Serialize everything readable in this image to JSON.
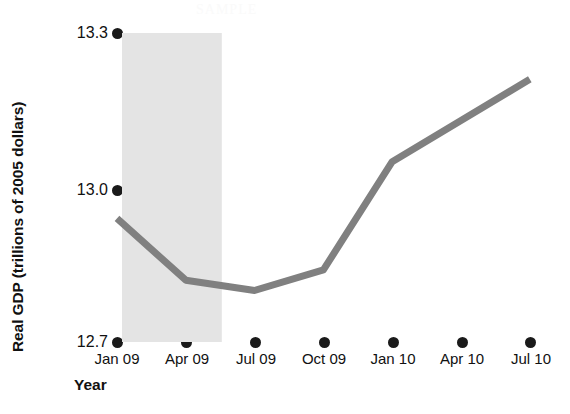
{
  "chart_data": {
    "type": "line",
    "title": "",
    "subtitle": "",
    "xlabel": "Year",
    "ylabel": "Real GDP (trillions of 2005 dollars)",
    "categories": [
      "Jan 09",
      "Apr 09",
      "Jul 09",
      "Oct 09",
      "Jan 10",
      "Apr 10",
      "Jul 10"
    ],
    "values": [
      12.94,
      12.82,
      12.8,
      12.84,
      13.05,
      13.13,
      13.21
    ],
    "series": [
      {
        "name": "Real GDP",
        "values": [
          12.94,
          12.82,
          12.8,
          12.84,
          13.05,
          13.13,
          13.21
        ]
      }
    ],
    "ylim": [
      12.7,
      13.3
    ],
    "yticks": [
      "12.7",
      "13.0",
      "13.3"
    ],
    "ytick_values": [
      12.7,
      13.0,
      13.3
    ],
    "xticks": [
      "Jan 09",
      "Apr 09",
      "Jul 09",
      "Oct 09",
      "Jan 10",
      "Apr 10",
      "Jul 10"
    ],
    "grid": false,
    "legend": "none",
    "line_color": "#808080",
    "marker_color": "#1a1a1a",
    "shaded_region": {
      "label": "recession band",
      "from": "Jan 09",
      "to": "Apr 09",
      "color": "#e4e4e4"
    },
    "annotations": []
  },
  "axis": {
    "y_title": "Real GDP (trillions of 2005 dollars)",
    "x_title": "Year",
    "y_tick_labels": [
      "13.3",
      "13.0",
      "12.7"
    ],
    "x_tick_labels": [
      "Jan 09",
      "Apr 09",
      "Jul 09",
      "Oct 09",
      "Jan 10",
      "Apr 10",
      "Jul 10"
    ]
  },
  "watermark": {
    "text": "SAMPLE"
  }
}
